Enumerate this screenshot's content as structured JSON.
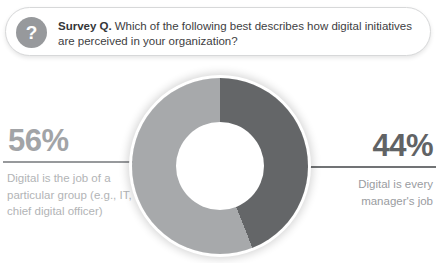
{
  "survey_box": {
    "icon_glyph": "?",
    "label": "Survey Q.",
    "question": "Which of the following best describes how digital initiatives are perceived in your organization?"
  },
  "chart_data": {
    "type": "pie",
    "donut": true,
    "hole_ratio": 0.5,
    "start_angle_deg": 0,
    "direction": "clockwise",
    "segments": [
      {
        "name": "Digital is every manager's job",
        "value": 44,
        "color": "#646668"
      },
      {
        "name": "Digital is the job of a particular group (e.g., IT, chief digital officer)",
        "value": 56,
        "color": "#a7a9ab"
      }
    ],
    "labels_position": "left and right of donut with leader lines"
  },
  "left_stat": {
    "value": "56%",
    "caption_lines": [
      "Digital is the job of a",
      "particular group (e.g., IT,",
      "chief digital officer)"
    ],
    "value_color": "#a2a4a7",
    "caption_color": "#b2b4b6",
    "line_color": "#97999c"
  },
  "right_stat": {
    "value": "44%",
    "caption_lines": [
      "Digital is every",
      "manager's job"
    ],
    "value_color": "#616365",
    "caption_color": "#9a9c9f",
    "line_color": "#717375"
  },
  "colors": {
    "background": "#ffffff",
    "box_border": "#d7d8d9",
    "icon_circle": "#97999c",
    "question_text": "#404042",
    "donut_dark": "#646668",
    "donut_light": "#a7a9ab"
  }
}
